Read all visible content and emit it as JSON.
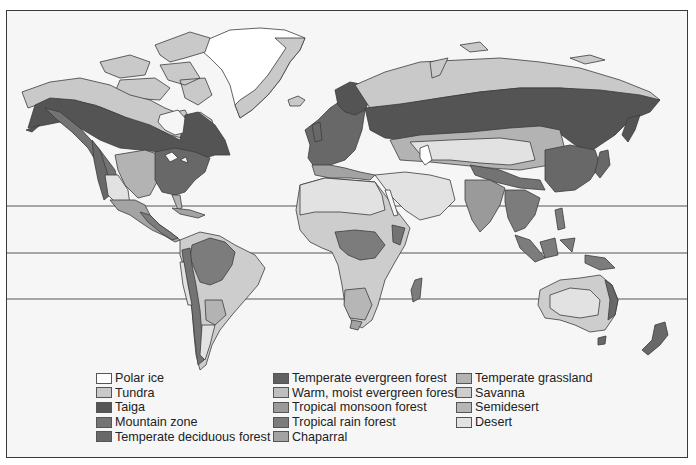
{
  "map": {
    "type": "world biome map",
    "latitude_lines": [
      {
        "name": "tropic-of-cancer",
        "y": 206
      },
      {
        "name": "equator",
        "y": 253
      },
      {
        "name": "tropic-of-capricorn",
        "y": 299
      }
    ],
    "colors": {
      "background": "#f6f6f6",
      "border": "#3a3a3a",
      "coast": "#3c3c3c"
    }
  },
  "legend": {
    "columns": [
      [
        {
          "label": "Polar ice",
          "color": "#ffffff"
        },
        {
          "label": "Tundra",
          "color": "#c9c9c9"
        },
        {
          "label": "Taiga",
          "color": "#545454"
        },
        {
          "label": "Mountain zone",
          "color": "#737373"
        },
        {
          "label": "Temperate deciduous forest",
          "color": "#686868"
        }
      ],
      [
        {
          "label": "Temperate evergreen forest",
          "color": "#606060"
        },
        {
          "label": "Warm, moist evergreen forest",
          "color": "#bebebe"
        },
        {
          "label": "Tropical monsoon forest",
          "color": "#9a9a9a"
        },
        {
          "label": "Tropical rain forest",
          "color": "#7c7c7c"
        },
        {
          "label": "Chaparral",
          "color": "#a3a3a3"
        }
      ],
      [
        {
          "label": "Temperate grassland",
          "color": "#b3b3b3"
        },
        {
          "label": "Savanna",
          "color": "#cdcdcd"
        },
        {
          "label": "Semidesert",
          "color": "#b6b6b6"
        },
        {
          "label": "Desert",
          "color": "#e2e2e2"
        }
      ]
    ]
  }
}
